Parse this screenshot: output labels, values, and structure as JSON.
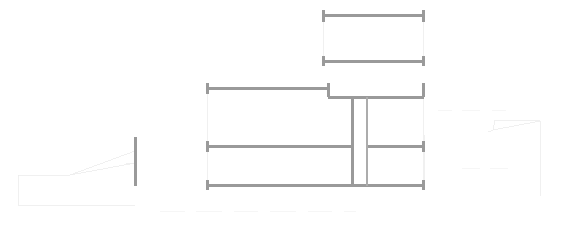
{
  "document": {
    "type": "architectural-floor-plan",
    "title": "",
    "background_color": "#ffffff",
    "canvas": {
      "width": 567,
      "height": 234
    }
  },
  "styles": {
    "wall_color": "#9a9a9a",
    "wall_light_color": "#acacac",
    "construction_color": "#ececec",
    "construction_faint_color": "#f4f4f4",
    "wall_thickness_major": 3.0,
    "wall_thickness_minor": 2.0,
    "construction_thickness": 0.8
  },
  "geometry": {
    "upper_room": {
      "name": "upper-room",
      "walls": [
        {
          "name": "upper-room-top-wall",
          "orientation": "horizontal",
          "x1": 325,
          "y1": 15.5,
          "x2": 422,
          "y2": 15.5,
          "weight": "major"
        },
        {
          "name": "upper-room-bottom-wall",
          "orientation": "horizontal",
          "x1": 325,
          "y1": 61.5,
          "x2": 422,
          "y2": 61.5,
          "weight": "major"
        },
        {
          "name": "upper-room-left-jamb-top",
          "orientation": "vertical",
          "x1": 323.5,
          "y1": 10,
          "x2": 323.5,
          "y2": 22,
          "weight": "major"
        },
        {
          "name": "upper-room-left-jamb-bottom",
          "orientation": "vertical",
          "x1": 323.5,
          "y1": 56,
          "x2": 323.5,
          "y2": 66,
          "weight": "major"
        },
        {
          "name": "upper-room-right-jamb-top",
          "orientation": "vertical",
          "x1": 423.5,
          "y1": 10,
          "x2": 423.5,
          "y2": 22,
          "weight": "major"
        },
        {
          "name": "upper-room-right-jamb-bottom",
          "orientation": "vertical",
          "x1": 423.5,
          "y1": 56,
          "x2": 423.5,
          "y2": 66,
          "weight": "major"
        }
      ],
      "construction_lines": [
        {
          "name": "upper-room-left-guide",
          "orientation": "vertical",
          "x1": 323.5,
          "y1": 22,
          "x2": 323.5,
          "y2": 56
        },
        {
          "name": "upper-room-right-guide",
          "orientation": "vertical",
          "x1": 423.5,
          "y1": 22,
          "x2": 423.5,
          "y2": 56
        }
      ]
    },
    "main_block": {
      "name": "main-block",
      "walls": [
        {
          "name": "main-top-wall-left-segment",
          "orientation": "horizontal",
          "x1": 208,
          "y1": 88,
          "x2": 329,
          "y2": 88,
          "weight": "major"
        },
        {
          "name": "main-top-wall-right-segment",
          "orientation": "horizontal",
          "x1": 328,
          "y1": 97,
          "x2": 424,
          "y2": 97,
          "weight": "major"
        },
        {
          "name": "main-mid-wall-left-segment",
          "orientation": "horizontal",
          "x1": 208,
          "y1": 146,
          "x2": 353,
          "y2": 146,
          "weight": "major"
        },
        {
          "name": "main-mid-wall-right-segment",
          "orientation": "horizontal",
          "x1": 366,
          "y1": 146,
          "x2": 424,
          "y2": 146,
          "weight": "major"
        },
        {
          "name": "main-bottom-wall",
          "orientation": "horizontal",
          "x1": 208,
          "y1": 185.5,
          "x2": 424,
          "y2": 185.5,
          "weight": "major"
        },
        {
          "name": "main-left-jamb-top",
          "orientation": "vertical",
          "x1": 207.5,
          "y1": 83,
          "x2": 207.5,
          "y2": 94,
          "weight": "major"
        },
        {
          "name": "main-left-jamb-mid",
          "orientation": "vertical",
          "x1": 207.5,
          "y1": 141,
          "x2": 207.5,
          "y2": 152,
          "weight": "major"
        },
        {
          "name": "main-left-jamb-bottom",
          "orientation": "vertical",
          "x1": 207.5,
          "y1": 180,
          "x2": 207.5,
          "y2": 190,
          "weight": "major"
        },
        {
          "name": "step-jamb",
          "orientation": "vertical",
          "x1": 328.5,
          "y1": 83,
          "x2": 328.5,
          "y2": 97,
          "weight": "major"
        },
        {
          "name": "main-right-jamb-top",
          "orientation": "vertical",
          "x1": 423.5,
          "y1": 83,
          "x2": 423.5,
          "y2": 97,
          "weight": "major"
        },
        {
          "name": "main-right-jamb-mid",
          "orientation": "vertical",
          "x1": 423.5,
          "y1": 141,
          "x2": 423.5,
          "y2": 152,
          "weight": "major"
        },
        {
          "name": "main-right-jamb-bottom",
          "orientation": "vertical",
          "x1": 423.5,
          "y1": 180,
          "x2": 423.5,
          "y2": 190,
          "weight": "major"
        },
        {
          "name": "central-partition-left",
          "orientation": "vertical",
          "x1": 352,
          "y1": 97,
          "x2": 352,
          "y2": 186,
          "weight": "major"
        },
        {
          "name": "central-partition-right",
          "orientation": "vertical",
          "x1": 367,
          "y1": 97,
          "x2": 367,
          "y2": 186,
          "weight": "minor"
        }
      ],
      "construction_lines": [
        {
          "name": "main-left-edge-guide-upper",
          "orientation": "vertical",
          "x1": 207.5,
          "y1": 94,
          "x2": 207.5,
          "y2": 141
        },
        {
          "name": "main-left-edge-guide-lower",
          "orientation": "vertical",
          "x1": 207.5,
          "y1": 152,
          "x2": 207.5,
          "y2": 180
        },
        {
          "name": "main-right-edge-guide-upper",
          "orientation": "vertical",
          "x1": 423.5,
          "y1": 97,
          "x2": 423.5,
          "y2": 141
        },
        {
          "name": "main-right-edge-guide-lower",
          "orientation": "vertical",
          "x1": 423.5,
          "y1": 152,
          "x2": 423.5,
          "y2": 180
        }
      ]
    },
    "isolated_column": {
      "name": "isolated-column",
      "walls": [
        {
          "name": "isolated-column-line",
          "orientation": "vertical",
          "x1": 135,
          "y1": 137,
          "x2": 135,
          "y2": 186,
          "weight": "major"
        }
      ]
    },
    "left_construction_shape": {
      "name": "left-construction-shape",
      "polylines": [
        {
          "name": "left-guide-upper-diagonal",
          "points": "70,175 135,163"
        },
        {
          "name": "left-guide-lower-diagonal",
          "points": "70,175 135,151"
        },
        {
          "name": "left-guide-vertex-to-edge",
          "points": "70,175 18,175"
        },
        {
          "name": "left-guide-left-vertical",
          "points": "18,175 18,205"
        },
        {
          "name": "left-guide-bottom",
          "points": "18,205 135,205"
        },
        {
          "name": "left-guide-hook",
          "points": "126,163 135,163"
        }
      ]
    },
    "right_construction_shape": {
      "name": "right-construction-shape",
      "polylines": [
        {
          "name": "right-guide-upper-diagonal",
          "points": "495,120 493,130"
        },
        {
          "name": "right-guide-slope",
          "points": "493,130 540,121"
        },
        {
          "name": "right-guide-top",
          "points": "495,120 540,121"
        },
        {
          "name": "right-guide-right-vertical",
          "points": "540,121 540,196"
        },
        {
          "name": "right-guide-hook",
          "points": "493,130 488,132"
        },
        {
          "name": "right-guide-left-tick",
          "points": "424,135 424,182"
        }
      ]
    },
    "bottom_guides": {
      "name": "bottom-guide-marks",
      "dashes": [
        {
          "name": "bottom-dash-1",
          "x1": 160,
          "y1": 211,
          "x2": 185,
          "y2": 211
        },
        {
          "name": "bottom-dash-2",
          "x1": 196,
          "y1": 211,
          "x2": 222,
          "y2": 211
        },
        {
          "name": "bottom-dash-3",
          "x1": 234,
          "y1": 211,
          "x2": 258,
          "y2": 211
        },
        {
          "name": "bottom-dash-4",
          "x1": 270,
          "y1": 211,
          "x2": 296,
          "y2": 211
        },
        {
          "name": "bottom-dash-5",
          "x1": 308,
          "y1": 211,
          "x2": 332,
          "y2": 211
        },
        {
          "name": "bottom-dash-6",
          "x1": 344,
          "y1": 211,
          "x2": 356,
          "y2": 211
        },
        {
          "name": "right-dash-1",
          "x1": 462,
          "y1": 168,
          "x2": 480,
          "y2": 168
        },
        {
          "name": "right-dash-2",
          "x1": 490,
          "y1": 168,
          "x2": 508,
          "y2": 168
        },
        {
          "name": "top-right-dash-1",
          "x1": 438,
          "y1": 110,
          "x2": 452,
          "y2": 110
        },
        {
          "name": "top-right-dash-2",
          "x1": 462,
          "y1": 110,
          "x2": 480,
          "y2": 110
        },
        {
          "name": "top-right-dash-3",
          "x1": 492,
          "y1": 110,
          "x2": 506,
          "y2": 110
        }
      ]
    }
  }
}
